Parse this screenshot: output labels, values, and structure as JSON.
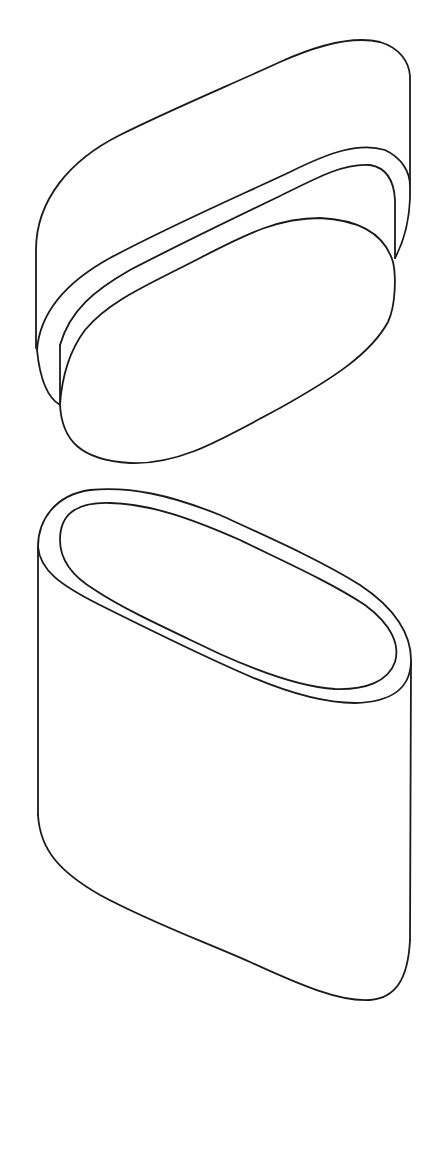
{
  "figure": {
    "background_color": "#ffffff",
    "line_color": "#1a1a1a",
    "components": [
      {
        "name": "lid",
        "parts": [
          "lid-top-surface",
          "lid-flange",
          "lid-insert-plug"
        ]
      },
      {
        "name": "container-body",
        "parts": [
          "rim-outer",
          "rim-inner",
          "side-wall",
          "base-edge"
        ]
      }
    ]
  }
}
